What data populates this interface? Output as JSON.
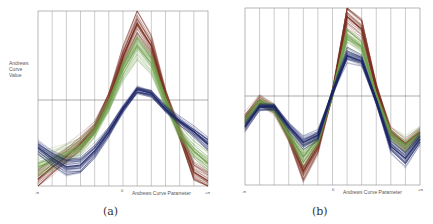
{
  "chart_data": [
    {
      "type": "line",
      "panel": "a",
      "caption": "(a)",
      "title": "",
      "xlabel": "Andrews Curve Parameter",
      "ylabel": "Andrews Curve Value",
      "x_ticks": [
        "-π",
        "0",
        "+π"
      ],
      "grid": {
        "vertical_lines": 12,
        "horizontal_lines": 1
      },
      "x": [
        -3.1416,
        -2.618,
        -2.0944,
        -1.5708,
        -1.0472,
        -0.5236,
        0,
        0.5236,
        1.0472,
        1.5708,
        2.0944,
        2.618,
        3.1416
      ],
      "ylim": [
        0,
        1
      ],
      "series": [
        {
          "name": "brown group",
          "color": "#7a2e1f",
          "spread": 0.06,
          "values": [
            0.04,
            0.11,
            0.17,
            0.24,
            0.33,
            0.5,
            0.74,
            0.93,
            0.8,
            0.52,
            0.3,
            0.08,
            0.03
          ]
        },
        {
          "name": "green group",
          "color": "#6fa04a",
          "spread": 0.07,
          "values": [
            0.11,
            0.14,
            0.18,
            0.22,
            0.31,
            0.46,
            0.66,
            0.8,
            0.7,
            0.48,
            0.3,
            0.2,
            0.13
          ]
        },
        {
          "name": "navy group",
          "color": "#1c2566",
          "spread": 0.035,
          "values": [
            0.22,
            0.16,
            0.11,
            0.12,
            0.2,
            0.31,
            0.44,
            0.55,
            0.53,
            0.44,
            0.37,
            0.31,
            0.24
          ]
        }
      ]
    },
    {
      "type": "line",
      "panel": "b",
      "caption": "(b)",
      "title": "",
      "xlabel": "Andrews Curve Parameter",
      "ylabel": "",
      "x_ticks": [
        "-π",
        "0",
        "+π"
      ],
      "grid": {
        "vertical_lines": 12,
        "horizontal_lines": 1
      },
      "x": [
        -3.1416,
        -2.618,
        -2.0944,
        -1.5708,
        -1.0472,
        -0.5236,
        0,
        0.5236,
        1.0472,
        1.5708,
        2.0944,
        2.618,
        3.1416
      ],
      "ylim": [
        0,
        1
      ],
      "series": [
        {
          "name": "brown group",
          "color": "#7a2e1f",
          "spread": 0.05,
          "values": [
            0.38,
            0.48,
            0.43,
            0.28,
            0.08,
            0.22,
            0.52,
            0.95,
            0.88,
            0.55,
            0.3,
            0.23,
            0.3
          ]
        },
        {
          "name": "green group",
          "color": "#6fa04a",
          "spread": 0.05,
          "values": [
            0.36,
            0.47,
            0.43,
            0.29,
            0.16,
            0.26,
            0.52,
            0.84,
            0.78,
            0.5,
            0.28,
            0.22,
            0.29
          ]
        },
        {
          "name": "navy group",
          "color": "#1c2566",
          "spread": 0.03,
          "values": [
            0.33,
            0.44,
            0.44,
            0.33,
            0.24,
            0.28,
            0.52,
            0.73,
            0.7,
            0.47,
            0.22,
            0.15,
            0.26
          ]
        }
      ]
    }
  ],
  "panels": {
    "a": {
      "ylabel_lines": [
        "Andrews",
        "Curve",
        "Value"
      ],
      "tick_left": "-π",
      "tick_zero": "0",
      "tick_right": "+π",
      "xlabel": "Andrews Curve Parameter",
      "caption": "(a)"
    },
    "b": {
      "tick_left": "-π",
      "tick_zero": "0",
      "tick_right": "+π",
      "xlabel": "Andrews Curve Parameter",
      "caption": "(b)"
    }
  }
}
